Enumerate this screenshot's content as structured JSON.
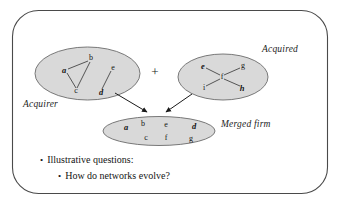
{
  "slide": {
    "frame": {
      "stroke_color": "#4a4a4a",
      "background": "#ffffff"
    },
    "ellipse_fill": "#d9d9d9",
    "ellipse_stroke": "#6b6b6b",
    "edge_color": "#3c3c3c",
    "arrow_color": "#1a1a1a"
  },
  "operator": {
    "plus": "+"
  },
  "acquirer": {
    "label": "Acquirer",
    "nodes": [
      {
        "id": "a",
        "text": "a",
        "x": 64,
        "y": 70,
        "style": "bold"
      },
      {
        "id": "b",
        "text": "b",
        "x": 91,
        "y": 58,
        "style": "plain"
      },
      {
        "id": "c",
        "text": "c",
        "x": 76,
        "y": 91,
        "style": "plain"
      },
      {
        "id": "e",
        "text": "e",
        "x": 113,
        "y": 68,
        "style": "plain"
      },
      {
        "id": "d",
        "text": "d",
        "x": 101,
        "y": 92,
        "style": "bold"
      }
    ],
    "edges": [
      {
        "from": "a",
        "to": "b"
      },
      {
        "from": "a",
        "to": "c"
      },
      {
        "from": "b",
        "to": "c"
      },
      {
        "from": "e",
        "to": "d"
      }
    ]
  },
  "acquired": {
    "label": "Acquired",
    "nodes": [
      {
        "id": "e",
        "text": "e",
        "x": 203,
        "y": 66,
        "style": "bold"
      },
      {
        "id": "g",
        "text": "g",
        "x": 243,
        "y": 66,
        "style": "plain"
      },
      {
        "id": "f",
        "text": "f",
        "x": 222,
        "y": 77,
        "style": "plain"
      },
      {
        "id": "i",
        "text": "i",
        "x": 204,
        "y": 88,
        "style": "plain"
      },
      {
        "id": "h",
        "text": "h",
        "x": 242,
        "y": 88,
        "style": "bold"
      }
    ],
    "edges": [
      {
        "from": "f",
        "to": "e"
      },
      {
        "from": "f",
        "to": "g"
      },
      {
        "from": "f",
        "to": "i"
      },
      {
        "from": "f",
        "to": "h"
      }
    ]
  },
  "merged": {
    "label": "Merged firm",
    "nodes": [
      {
        "id": "a",
        "text": "a",
        "x": 126,
        "y": 127,
        "style": "bold"
      },
      {
        "id": "b",
        "text": "b",
        "x": 143,
        "y": 124,
        "style": "plain"
      },
      {
        "id": "e",
        "text": "e",
        "x": 166,
        "y": 125,
        "style": "plain"
      },
      {
        "id": "d",
        "text": "d",
        "x": 194,
        "y": 126,
        "style": "bold"
      },
      {
        "id": "c",
        "text": "c",
        "x": 146,
        "y": 138,
        "style": "plain"
      },
      {
        "id": "f",
        "text": "f",
        "x": 166,
        "y": 138,
        "style": "plain"
      },
      {
        "id": "g",
        "text": "g",
        "x": 191,
        "y": 139,
        "style": "plain"
      }
    ],
    "edges": []
  },
  "arrows": [
    {
      "name": "acquirer-to-merged",
      "x1": 115,
      "y1": 93,
      "x2": 148,
      "y2": 114
    },
    {
      "name": "acquired-to-merged",
      "x1": 192,
      "y1": 94,
      "x2": 166,
      "y2": 114
    }
  ],
  "bullets": [
    {
      "marker": "•",
      "text": "Illustrative questions:"
    },
    {
      "marker": "•",
      "text": "How do networks evolve?"
    }
  ]
}
